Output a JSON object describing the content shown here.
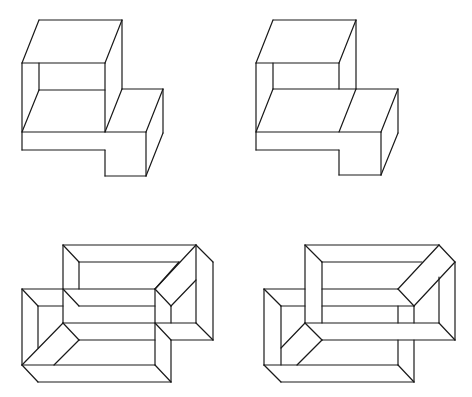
{
  "diagram": {
    "background": "#ffffff",
    "stroke": "#1a1a1a",
    "figures": [
      {
        "name": "figure-top-left",
        "segments": [
          [
            39,
            20,
            122,
            20
          ],
          [
            39,
            20,
            22,
            63
          ],
          [
            122,
            20,
            105,
            63
          ],
          [
            22,
            63,
            105,
            63
          ],
          [
            22,
            63,
            22,
            150
          ],
          [
            39,
            63,
            39,
            90
          ],
          [
            105,
            63,
            105,
            132
          ],
          [
            122,
            20,
            122,
            89
          ],
          [
            39,
            90,
            105,
            90
          ],
          [
            39,
            90,
            22,
            132
          ],
          [
            122,
            89,
            105,
            132
          ],
          [
            122,
            89,
            163,
            89
          ],
          [
            163,
            89,
            146,
            132
          ],
          [
            22,
            132,
            146,
            132
          ],
          [
            22,
            150,
            105,
            150
          ],
          [
            105,
            150,
            105,
            176
          ],
          [
            105,
            176,
            146,
            176
          ],
          [
            146,
            132,
            146,
            176
          ],
          [
            163,
            89,
            163,
            133
          ],
          [
            163,
            133,
            146,
            176
          ]
        ]
      },
      {
        "name": "figure-top-right",
        "segments": [
          [
            273,
            20,
            356,
            20
          ],
          [
            273,
            20,
            256,
            63
          ],
          [
            356,
            20,
            339,
            63
          ],
          [
            256,
            63,
            339,
            63
          ],
          [
            256,
            63,
            256,
            150
          ],
          [
            273,
            63,
            273,
            89
          ],
          [
            339,
            63,
            339,
            89
          ],
          [
            356,
            20,
            356,
            89
          ],
          [
            273,
            89,
            398,
            89
          ],
          [
            273,
            89,
            256,
            132
          ],
          [
            356,
            89,
            339,
            132
          ],
          [
            398,
            89,
            381,
            132
          ],
          [
            256,
            132,
            381,
            132
          ],
          [
            256,
            150,
            339,
            150
          ],
          [
            339,
            150,
            339,
            175
          ],
          [
            339,
            175,
            381,
            175
          ],
          [
            381,
            132,
            381,
            175
          ],
          [
            398,
            89,
            398,
            133
          ],
          [
            398,
            133,
            381,
            175
          ]
        ]
      },
      {
        "name": "figure-bottom-left",
        "segments": [
          [
            63,
            245,
            196,
            245
          ],
          [
            63,
            245,
            79,
            262
          ],
          [
            79,
            262,
            179,
            262
          ],
          [
            63,
            245,
            63,
            323
          ],
          [
            79,
            262,
            79,
            289
          ],
          [
            196,
            245,
            213,
            262
          ],
          [
            213,
            262,
            213,
            340
          ],
          [
            196,
            245,
            196,
            323
          ],
          [
            196,
            245,
            155,
            289
          ],
          [
            179,
            262,
            155,
            289
          ],
          [
            196,
            280,
            171,
            306
          ],
          [
            155,
            289,
            171,
            306
          ],
          [
            171,
            306,
            171,
            323
          ],
          [
            63,
            323,
            196,
            323
          ],
          [
            196,
            323,
            213,
            340
          ],
          [
            171,
            340,
            213,
            340
          ],
          [
            22,
            289,
            155,
            289
          ],
          [
            22,
            289,
            38,
            306
          ],
          [
            38,
            306,
            63,
            306
          ],
          [
            63,
            289,
            79,
            306
          ],
          [
            79,
            306,
            155,
            306
          ],
          [
            22,
            289,
            22,
            365
          ],
          [
            38,
            306,
            38,
            348
          ],
          [
            63,
            323,
            22,
            365
          ],
          [
            63,
            323,
            79,
            340
          ],
          [
            79,
            340,
            155,
            340
          ],
          [
            79,
            340,
            54,
            365
          ],
          [
            155,
            289,
            155,
            365
          ],
          [
            155,
            323,
            171,
            340
          ],
          [
            171,
            340,
            171,
            382
          ],
          [
            22,
            365,
            155,
            365
          ],
          [
            22,
            365,
            38,
            382
          ],
          [
            155,
            365,
            171,
            382
          ],
          [
            38,
            382,
            171,
            382
          ]
        ]
      },
      {
        "name": "figure-bottom-right",
        "segments": [
          [
            305,
            245,
            439,
            245
          ],
          [
            305,
            245,
            322,
            262
          ],
          [
            322,
            262,
            422,
            262
          ],
          [
            305,
            245,
            305,
            323
          ],
          [
            322,
            262,
            322,
            323
          ],
          [
            439,
            245,
            455,
            262
          ],
          [
            455,
            262,
            455,
            340
          ],
          [
            439,
            245,
            398,
            289
          ],
          [
            455,
            262,
            414,
            306
          ],
          [
            439,
            277,
            439,
            323
          ],
          [
            264,
            289,
            305,
            289
          ],
          [
            322,
            289,
            398,
            289
          ],
          [
            398,
            289,
            414,
            306
          ],
          [
            264,
            289,
            281,
            306
          ],
          [
            281,
            306,
            305,
            306
          ],
          [
            322,
            306,
            414,
            306
          ],
          [
            398,
            306,
            398,
            323
          ],
          [
            414,
            306,
            414,
            323
          ],
          [
            305,
            323,
            439,
            323
          ],
          [
            439,
            323,
            455,
            340
          ],
          [
            322,
            340,
            455,
            340
          ],
          [
            305,
            323,
            322,
            340
          ],
          [
            264,
            289,
            264,
            365
          ],
          [
            281,
            306,
            281,
            365
          ],
          [
            305,
            323,
            281,
            348
          ],
          [
            322,
            340,
            297,
            365
          ],
          [
            398,
            340,
            398,
            365
          ],
          [
            414,
            340,
            414,
            382
          ],
          [
            264,
            365,
            398,
            365
          ],
          [
            264,
            365,
            281,
            382
          ],
          [
            398,
            365,
            414,
            382
          ],
          [
            281,
            382,
            414,
            382
          ]
        ]
      }
    ]
  }
}
